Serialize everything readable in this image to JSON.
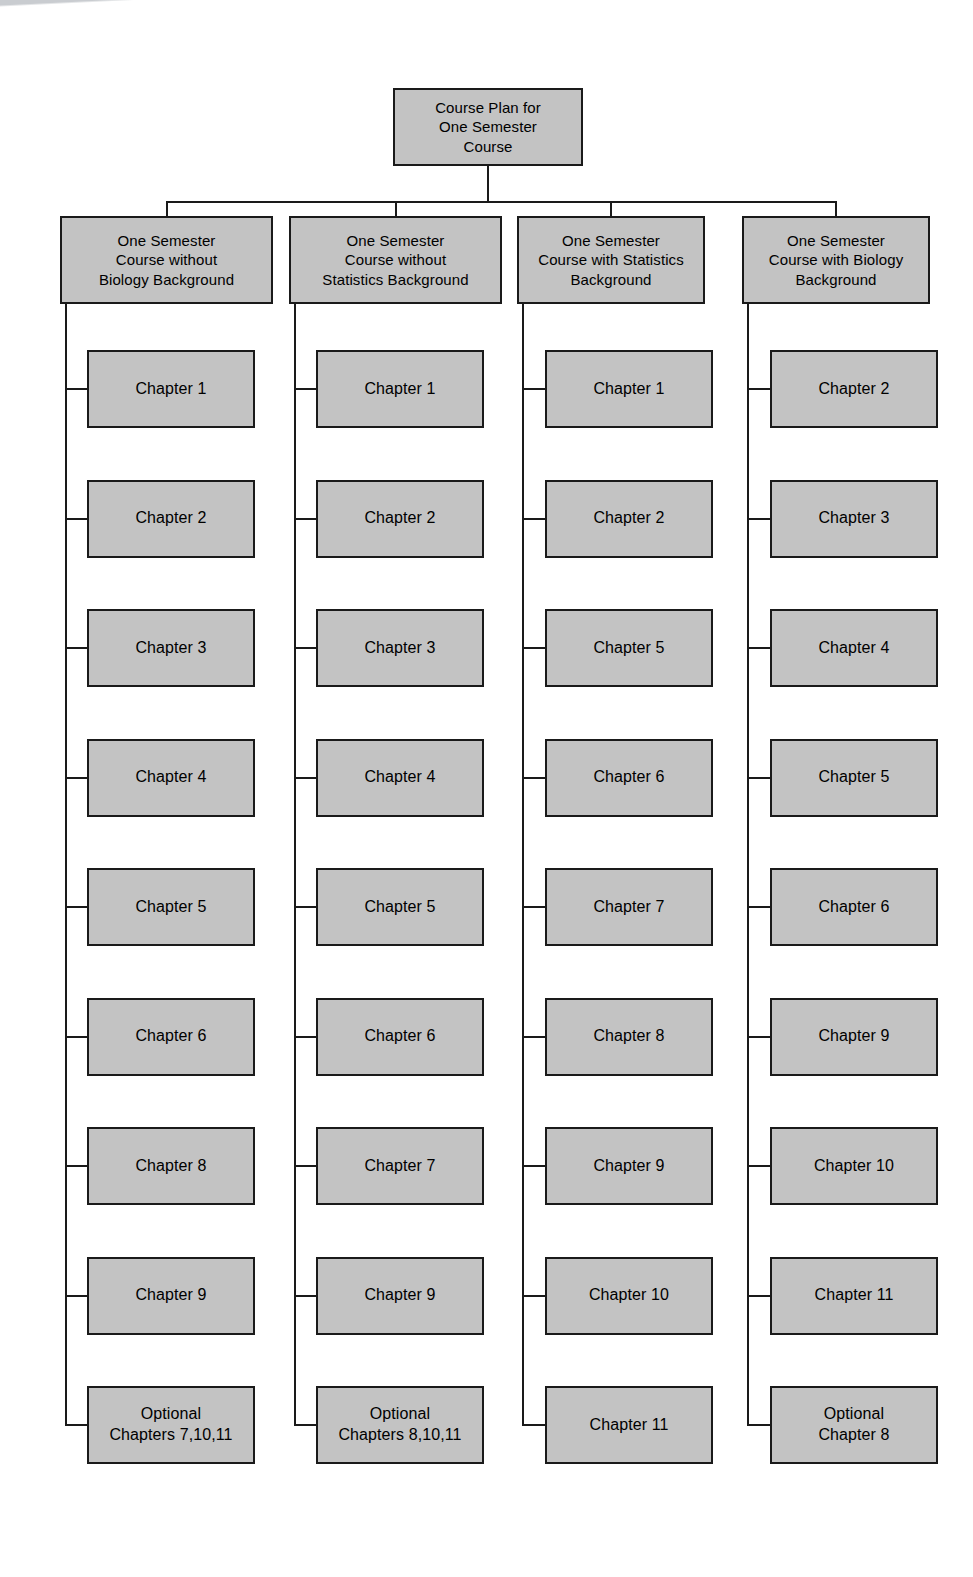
{
  "diagram": {
    "type": "tree",
    "title": "Course Plan for One Semester Course",
    "colors": {
      "node_fill": "#c3c3c3",
      "node_border": "#1a1a1a",
      "connector": "#1a1a1a",
      "background": "#ffffff",
      "text": "#000000"
    },
    "root": {
      "label": "Course Plan for\nOne Semester\nCourse"
    },
    "columns": [
      {
        "header": "One Semester\nCourse without\nBiology Background",
        "items": [
          "Chapter 1",
          "Chapter 2",
          "Chapter 3",
          "Chapter 4",
          "Chapter 5",
          "Chapter 6",
          "Chapter 8",
          "Chapter 9",
          "Optional\nChapters 7,10,11"
        ]
      },
      {
        "header": "One Semester\nCourse without\nStatistics Background",
        "items": [
          "Chapter 1",
          "Chapter 2",
          "Chapter 3",
          "Chapter 4",
          "Chapter 5",
          "Chapter 6",
          "Chapter 7",
          "Chapter 9",
          "Optional\nChapters 8,10,11"
        ]
      },
      {
        "header": "One Semester\nCourse with Statistics\nBackground",
        "items": [
          "Chapter 1",
          "Chapter 2",
          "Chapter 5",
          "Chapter 6",
          "Chapter 7",
          "Chapter 8",
          "Chapter 9",
          "Chapter 10",
          "Chapter 11"
        ]
      },
      {
        "header": "One Semester\nCourse with Biology\nBackground",
        "items": [
          "Chapter 2",
          "Chapter 3",
          "Chapter 4",
          "Chapter 5",
          "Chapter 6",
          "Chapter 9",
          "Chapter 10",
          "Chapter 11",
          "Optional\nChapter 8"
        ]
      }
    ]
  }
}
